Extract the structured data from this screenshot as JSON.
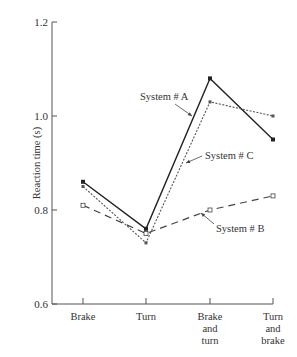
{
  "chart_data": {
    "type": "line",
    "title": "",
    "xlabel": "",
    "ylabel": "Reaction time (s)",
    "ylim": [
      0.6,
      1.2
    ],
    "yticks": [
      0.6,
      0.8,
      1.0,
      1.2
    ],
    "ytick_labels": [
      "0.6",
      "0.8",
      "1.0",
      "1.2"
    ],
    "grid": false,
    "legend": "none (inline annotations with arrows)",
    "categories": [
      "Brake",
      "Turn",
      "Brake and turn",
      "Turn and brake"
    ],
    "category_lines": [
      [
        "Brake"
      ],
      [
        "Turn"
      ],
      [
        "Brake",
        "and",
        "turn"
      ],
      [
        "Turn",
        "and",
        "brake"
      ]
    ],
    "series": [
      {
        "name": "System # A",
        "values": [
          0.86,
          0.76,
          1.08,
          0.95
        ],
        "style": "solid",
        "marker": "filled-square",
        "color": "#222222"
      },
      {
        "name": "System # B",
        "values": [
          0.81,
          0.75,
          0.8,
          0.83
        ],
        "style": "long-dash",
        "marker": "open-square",
        "color": "#444444"
      },
      {
        "name": "System # C",
        "values": [
          0.85,
          0.73,
          1.03,
          1.0
        ],
        "style": "dotted",
        "marker": "small-square",
        "color": "#555555"
      }
    ],
    "annotations": [
      {
        "text": "System # A",
        "target_series": "System # A"
      },
      {
        "text": "System # C",
        "target_series": "System # C"
      },
      {
        "text": "System # B",
        "target_series": "System # B"
      }
    ]
  }
}
